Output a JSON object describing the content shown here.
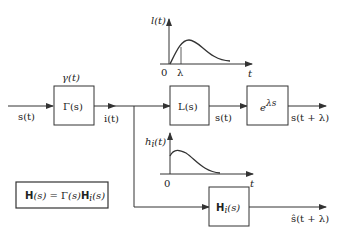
{
  "diagram": {
    "input_signal": "s(t)",
    "gamma_block": {
      "label": "Γ(s)",
      "impulse_label": "γ(t)"
    },
    "intermediate_signal": "i(t)",
    "l_block": {
      "label": "L(s)"
    },
    "l_output_signal": "s(t)",
    "delay_block": {
      "label": "e",
      "exponent": "λs"
    },
    "upper_output": "s(t + λ)",
    "hi_block": {
      "label": "H",
      "subscript": "i",
      "arg": "(s)"
    },
    "lower_output": "ŝ(t + λ)",
    "equation": "H(s) = Γ(s)H_i(s)",
    "equation_parts": {
      "H": "H",
      "s1": "(s) = ",
      "G": "Γ",
      "s2": "(s)",
      "Hi": "H",
      "i": "i",
      "s3": "(s)"
    },
    "plot_l": {
      "ylabel": "l(t)",
      "xlabel": "t",
      "origin": "0",
      "marker": "λ"
    },
    "plot_hi": {
      "ylabel": "h",
      "ysub": "i",
      "yarg": "(t)",
      "xlabel": "t",
      "origin": "0"
    }
  },
  "colors": {
    "line": "#333333",
    "background": "#ffffff"
  }
}
